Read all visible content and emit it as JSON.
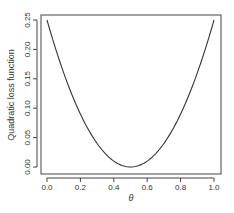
{
  "chart_data": {
    "type": "line",
    "title": "",
    "xlabel": "θ",
    "ylabel": "Quadratic loss function",
    "xlim": [
      0.0,
      1.0
    ],
    "ylim": [
      0.0,
      0.25
    ],
    "xticks": [
      "0.0",
      "0.2",
      "0.4",
      "0.6",
      "0.8",
      "1.0"
    ],
    "yticks": [
      "0.00",
      "0.05",
      "0.10",
      "0.15",
      "0.20",
      "0.25"
    ],
    "grid": false,
    "legend": null,
    "series": [
      {
        "name": "(θ - 0.5)^2",
        "x": [
          0.0,
          0.1,
          0.2,
          0.3,
          0.4,
          0.5,
          0.6,
          0.7,
          0.8,
          0.9,
          1.0
        ],
        "values": [
          0.25,
          0.16,
          0.09,
          0.04,
          0.01,
          0.0,
          0.01,
          0.04,
          0.09,
          0.16,
          0.25
        ],
        "color": "#333333"
      }
    ]
  }
}
